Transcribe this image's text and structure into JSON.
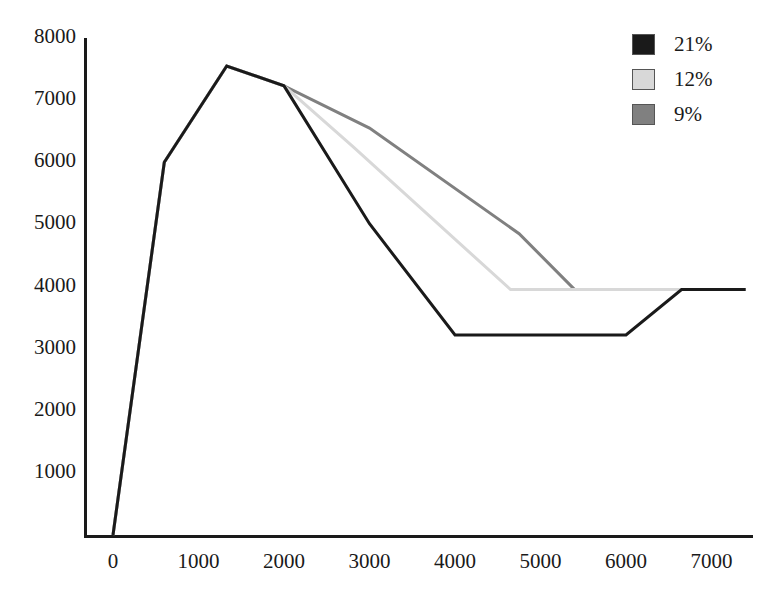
{
  "chart_data": {
    "type": "line",
    "title": "",
    "xlabel": "",
    "ylabel": "",
    "xlim": [
      -250,
      7700
    ],
    "ylim": [
      0,
      8000
    ],
    "grid": false,
    "legend_position": "top-right",
    "x_ticks": [
      "0",
      "1000",
      "2000",
      "3000",
      "4000",
      "5000",
      "6000",
      "7000"
    ],
    "x_tick_values": [
      0,
      1000,
      2000,
      3000,
      4000,
      5000,
      6000,
      7000
    ],
    "y_ticks": [
      "1000",
      "2000",
      "3000",
      "4000",
      "5000",
      "6000",
      "7000",
      "8000"
    ],
    "y_tick_values": [
      1000,
      2000,
      3000,
      4000,
      5000,
      6000,
      7000,
      8000
    ],
    "series": [
      {
        "name": "21%",
        "color": "#1a1a1a",
        "width": 3.0,
        "points": [
          [
            0,
            0
          ],
          [
            600,
            6000
          ],
          [
            1330,
            7550
          ],
          [
            2000,
            7230
          ],
          [
            3000,
            5010
          ],
          [
            4000,
            3220
          ],
          [
            6000,
            3220
          ],
          [
            6650,
            3950
          ],
          [
            7400,
            3950
          ]
        ]
      },
      {
        "name": "12%",
        "color": "#d8d8d8",
        "width": 3.0,
        "points": [
          [
            0,
            0
          ],
          [
            600,
            6000
          ],
          [
            1330,
            7550
          ],
          [
            2000,
            7230
          ],
          [
            2800,
            6260
          ],
          [
            4650,
            3950
          ],
          [
            7400,
            3950
          ]
        ]
      },
      {
        "name": "9%",
        "color": "#808080",
        "width": 3.0,
        "points": [
          [
            0,
            0
          ],
          [
            600,
            6000
          ],
          [
            1330,
            7550
          ],
          [
            2000,
            7230
          ],
          [
            3000,
            6550
          ],
          [
            4750,
            4850
          ],
          [
            5400,
            3950
          ]
        ]
      }
    ]
  },
  "legend": {
    "items": [
      {
        "label": "21%",
        "color": "#1a1a1a"
      },
      {
        "label": "12%",
        "color": "#d8d8d8"
      },
      {
        "label": "9%",
        "color": "#808080"
      }
    ]
  },
  "axes": {
    "axis_color": "#1a1a1a"
  }
}
